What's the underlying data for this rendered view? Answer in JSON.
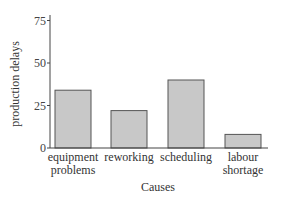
{
  "chart_data": {
    "type": "bar",
    "title": "",
    "categories": [
      "equipment problems",
      "reworking",
      "scheduling",
      "labour shortage"
    ],
    "category_lines": [
      [
        "equipment",
        "problems"
      ],
      [
        "reworking"
      ],
      [
        "scheduling"
      ],
      [
        "labour",
        "shortage"
      ]
    ],
    "values": [
      34,
      22,
      40,
      8
    ],
    "xlabel": "Causes",
    "ylabel": "production delays",
    "ylim": [
      0,
      80
    ],
    "yticks": [
      0,
      25,
      50,
      75
    ],
    "grid": false,
    "legend": null,
    "colors": {
      "bar_fill": "#c8c8c8",
      "bar_stroke": "#555555",
      "axis": "#444444"
    }
  }
}
